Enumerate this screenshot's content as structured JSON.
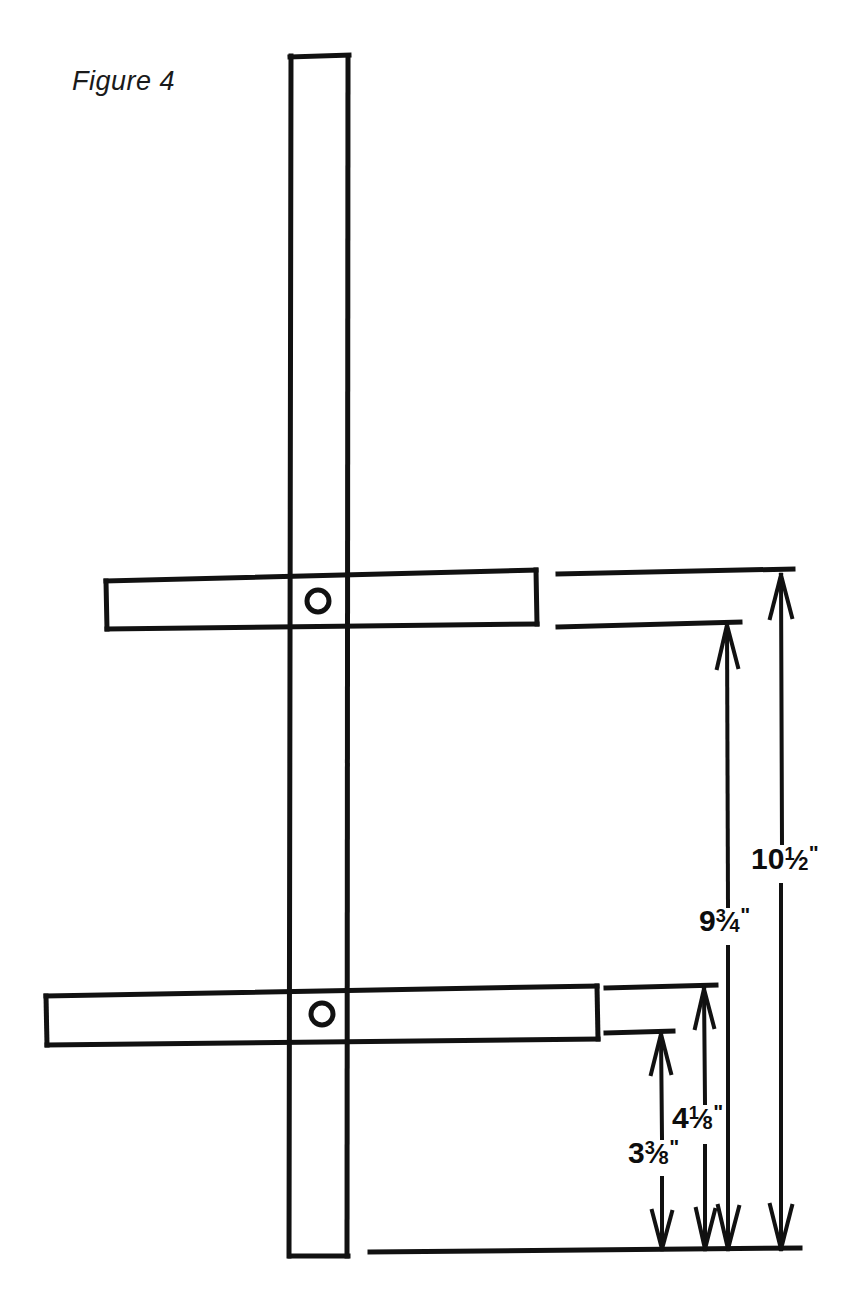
{
  "figure": {
    "caption": "Figure 4",
    "units": "inches",
    "line_color": "#111111",
    "background_color": "#ffffff"
  },
  "parts": {
    "vertical_post": {
      "name": "vertical-post",
      "left": 290,
      "right": 348,
      "top": 56,
      "bottom": 1256
    },
    "upper_crossbar": {
      "name": "upper-crossbar",
      "left": 105,
      "right": 537,
      "top": 573,
      "bottom": 629,
      "hole": {
        "cx": 318,
        "cy": 601,
        "r": 11
      }
    },
    "lower_crossbar": {
      "name": "lower-crossbar",
      "left": 45,
      "right": 598,
      "top": 987,
      "bottom": 1044,
      "hole": {
        "cx": 322,
        "cy": 1014,
        "r": 11
      }
    },
    "baseline": {
      "name": "baseline",
      "left": 370,
      "right": 800,
      "y": 1251
    }
  },
  "dimensions": [
    {
      "id": "dim-10-half",
      "name": "dimension-10-and-a-half-inches",
      "whole": "10",
      "numerator": "1",
      "denominator": "2",
      "inch_mark": "\"",
      "text": "10 1/2\"",
      "value_inches": 10.5,
      "measures": "baseline to top of upper crossbar",
      "line_x": 781,
      "top_y": 573,
      "bottom_y": 1251,
      "gap_top": 843,
      "gap_bottom": 885,
      "label_left": 751,
      "label_top": 842,
      "extension_line": {
        "x1": 558,
        "x2": 793,
        "y": 573
      }
    },
    {
      "id": "dim-9-three-quarters",
      "name": "dimension-9-and-three-quarters-inches",
      "whole": "9",
      "numerator": "3",
      "denominator": "4",
      "inch_mark": "\"",
      "text": "9 3/4\"",
      "value_inches": 9.75,
      "measures": "baseline to bottom of upper crossbar",
      "line_x": 727,
      "top_y": 623,
      "bottom_y": 1251,
      "gap_top": 906,
      "gap_bottom": 947,
      "label_left": 699,
      "label_top": 904,
      "extension_line": {
        "x1": 558,
        "x2": 740,
        "y": 623
      }
    },
    {
      "id": "dim-4-one-eighth",
      "name": "dimension-4-and-one-eighth-inches",
      "whole": "4",
      "numerator": "1",
      "denominator": "8",
      "inch_mark": "\"",
      "text": "4 1/8\"",
      "value_inches": 4.125,
      "measures": "baseline to top of lower crossbar",
      "line_x": 704,
      "top_y": 987,
      "bottom_y": 1251,
      "gap_top": 1103,
      "gap_bottom": 1146,
      "label_left": 672,
      "label_top": 1101,
      "extension_line": {
        "x1": 606,
        "x2": 716,
        "y": 987
      }
    },
    {
      "id": "dim-3-three-eighths",
      "name": "dimension-3-and-three-eighths-inches",
      "whole": "3",
      "numerator": "3",
      "denominator": "8",
      "inch_mark": "\"",
      "text": "3 3/8\"",
      "value_inches": 3.375,
      "measures": "baseline to bottom of lower crossbar",
      "line_x": 661,
      "top_y": 1032,
      "bottom_y": 1251,
      "gap_top": 1138,
      "gap_bottom": 1178,
      "label_left": 628,
      "label_top": 1136,
      "extension_line": {
        "x1": 606,
        "x2": 673,
        "y": 1032
      }
    }
  ]
}
